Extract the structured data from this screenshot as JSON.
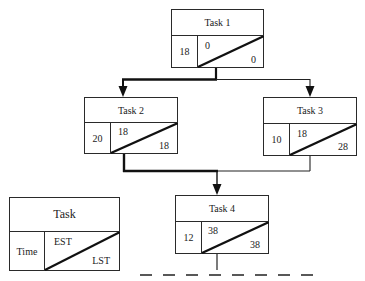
{
  "diagram": {
    "type": "activity-on-node network (critical path)",
    "tasks": [
      {
        "name": "Task 1",
        "time": "18",
        "est": "0",
        "lst": "0"
      },
      {
        "name": "Task 2",
        "time": "20",
        "est": "18",
        "lst": "18"
      },
      {
        "name": "Task 3",
        "time": "10",
        "est": "18",
        "lst": "28"
      },
      {
        "name": "Task 4",
        "time": "12",
        "est": "38",
        "lst": "38"
      }
    ],
    "edges": [
      {
        "from": "Task 1",
        "to": "Task 2",
        "critical": true
      },
      {
        "from": "Task 1",
        "to": "Task 3",
        "critical": false
      },
      {
        "from": "Task 2",
        "to": "Task 4",
        "critical": true
      },
      {
        "from": "Task 3",
        "to": "Task 4",
        "critical": false
      }
    ],
    "legend": {
      "title": "Task",
      "time": "Time",
      "est": "EST",
      "lst": "LST"
    },
    "continuation": "dashed-line"
  }
}
